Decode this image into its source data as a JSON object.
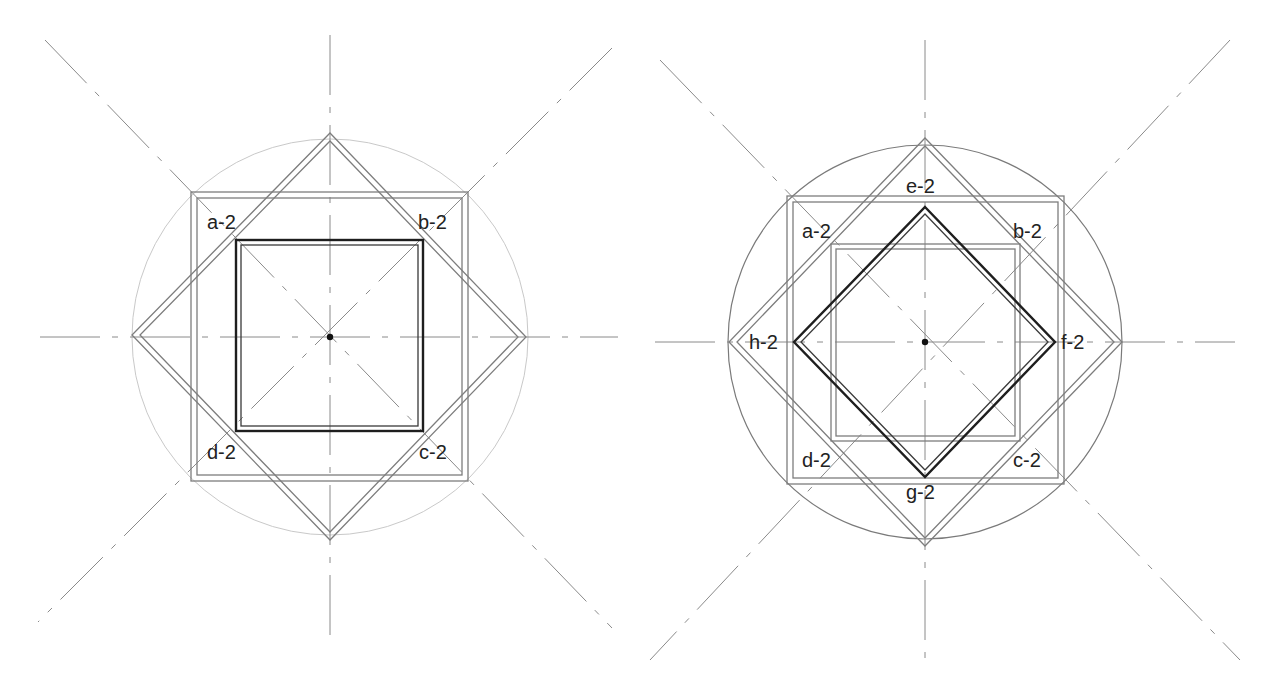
{
  "figures": [
    {
      "id": "left",
      "center": [
        330,
        337
      ],
      "circle": {
        "r": 198,
        "style": "circle-faint"
      },
      "axes": {
        "vertical": [
          [
            330,
            35
          ],
          [
            330,
            640
          ]
        ],
        "horizontal": [
          [
            40,
            337
          ],
          [
            618,
            337
          ]
        ],
        "diagonals": [
          [
            [
              45,
              40
            ],
            [
              612,
              628
            ]
          ],
          [
            [
              612,
              48
            ],
            [
              38,
              622
            ]
          ]
        ]
      },
      "outer_square": {
        "outer": [
          191,
          192,
          468,
          481
        ],
        "inner": [
          197,
          198,
          462,
          475
        ]
      },
      "outer_diamond": {
        "outer": [
          [
            330,
            133
          ],
          [
            526,
            337
          ],
          [
            330,
            540
          ],
          [
            132,
            335
          ]
        ],
        "inner": [
          [
            330,
            141
          ],
          [
            518,
            337
          ],
          [
            330,
            532
          ],
          [
            140,
            335
          ]
        ]
      },
      "bold_shape": {
        "type": "square",
        "outer": [
          236,
          240,
          423,
          431
        ],
        "inner": [
          241,
          245,
          418,
          426
        ]
      },
      "mid_square": null,
      "labels": [
        {
          "text": "a-2",
          "x": 207,
          "y": 229
        },
        {
          "text": "b-2",
          "x": 418,
          "y": 229
        },
        {
          "text": "c-2",
          "x": 419,
          "y": 459
        },
        {
          "text": "d-2",
          "x": 207,
          "y": 459
        }
      ]
    },
    {
      "id": "right",
      "center": [
        925,
        342
      ],
      "circle": {
        "r": 197,
        "style": "circle-solid"
      },
      "axes": {
        "vertical": [
          [
            925,
            40
          ],
          [
            925,
            668
          ]
        ],
        "horizontal": [
          [
            655,
            342
          ],
          [
            1235,
            342
          ]
        ],
        "diagonals": [
          [
            [
              660,
              60
            ],
            [
              1240,
              660
            ]
          ],
          [
            [
              1230,
              40
            ],
            [
              650,
              660
            ]
          ]
        ]
      },
      "outer_square": {
        "outer": [
          787,
          196,
          1064,
          484
        ],
        "inner": [
          793,
          202,
          1058,
          478
        ]
      },
      "outer_diamond": {
        "outer": [
          [
            925,
            138
          ],
          [
            1122,
            342
          ],
          [
            925,
            546
          ],
          [
            729,
            342
          ]
        ],
        "inner": [
          [
            925,
            146
          ],
          [
            1114,
            342
          ],
          [
            925,
            538
          ],
          [
            737,
            342
          ]
        ]
      },
      "bold_shape": {
        "type": "diamond",
        "outer": [
          [
            925,
            207
          ],
          [
            1055,
            342
          ],
          [
            925,
            477
          ],
          [
            794,
            342
          ]
        ],
        "inner": [
          [
            925,
            214
          ],
          [
            1048,
            342
          ],
          [
            925,
            470
          ],
          [
            801,
            342
          ]
        ]
      },
      "mid_square": {
        "outer": [
          831,
          244,
          1020,
          441
        ],
        "inner": [
          836,
          249,
          1015,
          436
        ]
      },
      "labels": [
        {
          "text": "e-2",
          "x": 906,
          "y": 193
        },
        {
          "text": "f-2",
          "x": 1061,
          "y": 349
        },
        {
          "text": "g-2",
          "x": 906,
          "y": 499
        },
        {
          "text": "h-2",
          "x": 749,
          "y": 349
        },
        {
          "text": "a-2",
          "x": 802,
          "y": 238
        },
        {
          "text": "b-2",
          "x": 1013,
          "y": 238
        },
        {
          "text": "c-2",
          "x": 1013,
          "y": 467
        },
        {
          "text": "d-2",
          "x": 802,
          "y": 467
        }
      ]
    }
  ],
  "colors": {
    "background": "#ffffff",
    "bold_line": "#1e1e1e",
    "double_line": "#7d7d7d",
    "guide_line": "#9a9a9a"
  }
}
